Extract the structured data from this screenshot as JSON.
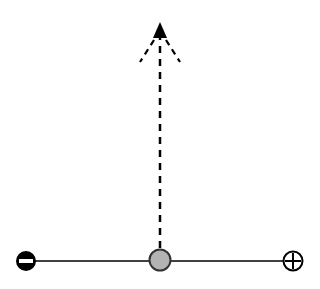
{
  "diagram": {
    "type": "electric-field-charge-diagram",
    "wire": {
      "x1": 26,
      "y1": 261,
      "x2": 293,
      "y2": 261,
      "color": "#000000"
    },
    "negative_terminal": {
      "symbol": "−",
      "cx": 26,
      "cy": 261,
      "r": 10,
      "fill": "#000000",
      "symbol_color": "#ffffff"
    },
    "positive_terminal": {
      "symbol": "+",
      "cx": 293,
      "cy": 261,
      "r": 10,
      "fill": "#ffffff",
      "stroke": "#000000"
    },
    "charge": {
      "cx": 160,
      "cy": 260,
      "r": 11,
      "fill": "#b3b3b3",
      "stroke": "#333333"
    },
    "force_arrow": {
      "style": "dashed",
      "x": 160,
      "y_start": 248,
      "y_end": 30,
      "tip_y": 22,
      "color": "#000000"
    },
    "spread_lines": {
      "style": "dashed",
      "left": {
        "x1": 153,
        "y1": 38,
        "x2": 140,
        "y2": 62
      },
      "right": {
        "x1": 167,
        "y1": 38,
        "x2": 180,
        "y2": 62
      },
      "color": "#000000"
    }
  }
}
